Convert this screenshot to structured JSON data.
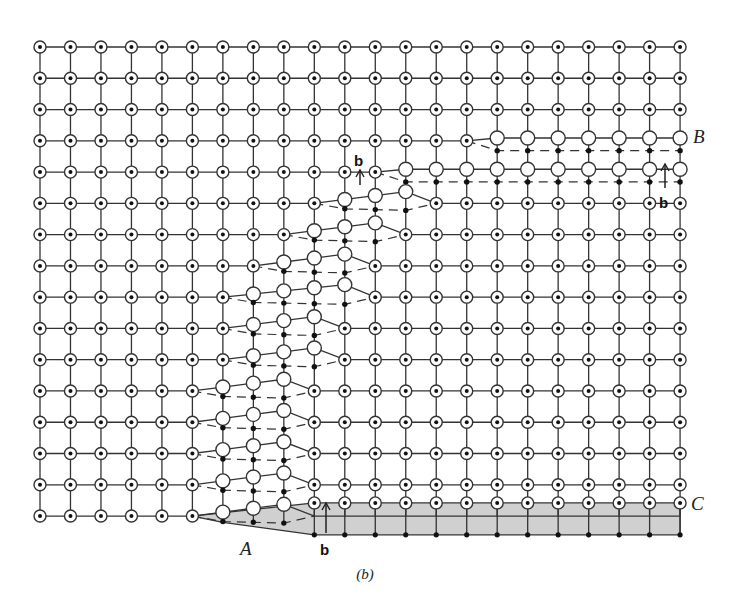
{
  "figure": {
    "caption": "(b)",
    "labels": {
      "A": "A",
      "B": "B",
      "C": "C",
      "burgers_top": "b",
      "burgers_right": "b",
      "burgers_bottom": "b"
    },
    "colors": {
      "line": "#333333",
      "atom_stroke": "#333333",
      "atom_fill": "#ffffff",
      "dot": "#111111",
      "shade": "#d0d0d0"
    },
    "grid": {
      "cols": 22,
      "rows": 16,
      "x0": 40,
      "dx": 30.48,
      "y0": 47,
      "dy": 31.27
    },
    "legend_note": "Square lattice: ◉ atoms in both planes coincide, ○ upper-plane atoms, • lower-plane atoms, dashed lines connect lower plane",
    "slip_bands": [
      {
        "row": 3,
        "s": 14,
        "e": 21,
        "kind": "top"
      },
      {
        "row": 4,
        "s": 11,
        "e": 21,
        "kind": "top"
      },
      {
        "row": 5,
        "s": 9,
        "e": 13,
        "kind": "mid"
      },
      {
        "row": 6,
        "s": 8,
        "e": 12,
        "kind": "mid"
      },
      {
        "row": 7,
        "s": 7,
        "e": 11,
        "kind": "mid"
      },
      {
        "row": 8,
        "s": 6,
        "e": 11,
        "kind": "mid"
      },
      {
        "row": 9,
        "s": 6,
        "e": 10,
        "kind": "mid"
      },
      {
        "row": 10,
        "s": 6,
        "e": 10,
        "kind": "mid"
      },
      {
        "row": 11,
        "s": 5,
        "e": 9,
        "kind": "mid"
      },
      {
        "row": 12,
        "s": 5,
        "e": 9,
        "kind": "mid"
      },
      {
        "row": 13,
        "s": 5,
        "e": 9,
        "kind": "mid"
      },
      {
        "row": 14,
        "s": 5,
        "e": 9,
        "kind": "mid"
      },
      {
        "row": 15,
        "s": 5,
        "e": 9,
        "kind": "bottom"
      }
    ],
    "bottom_shaded": {
      "s": 5,
      "end_col": 21
    }
  }
}
